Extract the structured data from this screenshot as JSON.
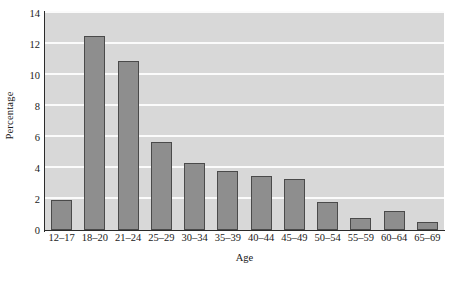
{
  "chart_data": {
    "type": "bar",
    "title": "",
    "xlabel": "Age",
    "ylabel": "Percentage",
    "categories": [
      "12–17",
      "18–20",
      "21–24",
      "25–29",
      "30–34",
      "35–39",
      "40–44",
      "45–49",
      "50–54",
      "55–59",
      "60–64",
      "65–69"
    ],
    "values": [
      1.95,
      12.5,
      10.9,
      5.65,
      4.3,
      3.8,
      3.5,
      3.3,
      1.8,
      0.75,
      1.25,
      0.5
    ],
    "ylim": [
      0,
      14
    ],
    "yticks": [
      0,
      2,
      4,
      6,
      8,
      10,
      12,
      14
    ],
    "ytick_labels": [
      "0",
      "2",
      "4",
      "6",
      "8",
      "10",
      "12",
      "14"
    ],
    "grid": true,
    "grid_axis": "y",
    "legend": false,
    "colors": {
      "bar_fill": "#8e8e8e",
      "bar_edge": "#4a4a4a",
      "plot_background": "#d8d8d8",
      "gridline": "#fbfbfb",
      "axis": "#2b2b2b",
      "text": "#1a1a1a",
      "figure_background": "#ffffff"
    }
  }
}
